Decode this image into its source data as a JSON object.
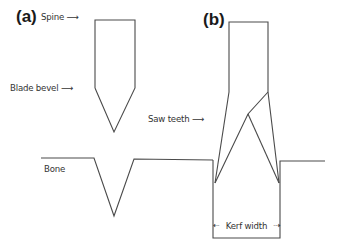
{
  "figure": {
    "panel_a": {
      "label": "(a)",
      "spine_label": "Spine",
      "bevel_label": "Blade bevel",
      "bone_label": "Bone"
    },
    "panel_b": {
      "label": "(b)",
      "teeth_label": "Saw teeth",
      "kerf_label": "Kerf width"
    },
    "arrow_glyph": "⟶",
    "colors": {
      "line": "#4a4a4a",
      "text": "#333333",
      "background": "#ffffff"
    }
  }
}
